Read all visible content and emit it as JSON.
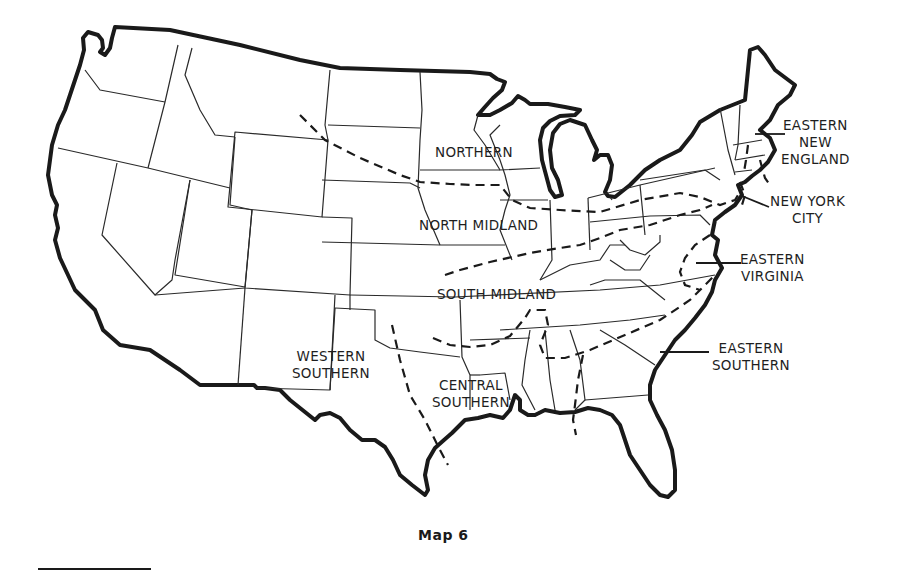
{
  "map": {
    "caption": "Map 6",
    "subject": "United States dialect regions",
    "colors": {
      "background": "#ffffff",
      "line": "#1a1a1a"
    },
    "regions": [
      {
        "id": "northern",
        "lines": [
          "NORTHERN"
        ]
      },
      {
        "id": "north-midland",
        "lines": [
          "NORTH MIDLAND"
        ]
      },
      {
        "id": "south-midland",
        "lines": [
          "SOUTH MIDLAND"
        ]
      },
      {
        "id": "western-southern",
        "lines": [
          "WESTERN",
          "SOUTHERN"
        ]
      },
      {
        "id": "central-southern",
        "lines": [
          "CENTRAL",
          "SOUTHERN"
        ]
      },
      {
        "id": "eastern-new-england",
        "lines": [
          "EASTERN",
          "NEW",
          "ENGLAND"
        ]
      },
      {
        "id": "new-york-city",
        "lines": [
          "NEW YORK",
          "CITY"
        ]
      },
      {
        "id": "eastern-virginia",
        "lines": [
          "EASTERN",
          "VIRGINIA"
        ]
      },
      {
        "id": "eastern-southern",
        "lines": [
          "EASTERN",
          "SOUTHERN"
        ]
      }
    ]
  }
}
